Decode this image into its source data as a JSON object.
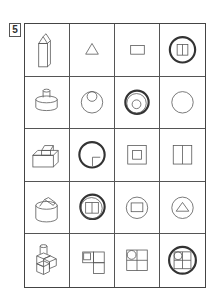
{
  "problem": {
    "number": "5",
    "rows": 5,
    "columns": 4
  },
  "grid": [
    {
      "row": 1,
      "object": "house-shaped prism (pentagonal prism standing upright)",
      "views": [
        "triangle",
        "rectangle",
        "circled square split vertically (answer)"
      ]
    },
    {
      "row": 2,
      "object": "cylinder with small cylinder on top",
      "views": [
        "circle with small circle inside at top",
        "circled concentric circles (answer)",
        "circle"
      ]
    },
    {
      "row": 3,
      "object": "box with small box on top corner",
      "views": [
        "circled square with small square at bottom-right (answer)",
        "square within square",
        "square split vertically"
      ]
    },
    {
      "row": 4,
      "object": "cylinder with triangular prism on top",
      "views": [
        "circled circle with square split vertically (answer)",
        "circle with rectangle",
        "circle with triangle"
      ]
    },
    {
      "row": 5,
      "object": "stacked cubes with cylinder on top",
      "views": [
        "L-shape of squares with small square",
        "2x2 squares with circle at top-left",
        "circled 2x2 squares with circle at top-left (answer)"
      ]
    }
  ],
  "colors": {
    "line": "#555555",
    "highlight": "#333333"
  }
}
